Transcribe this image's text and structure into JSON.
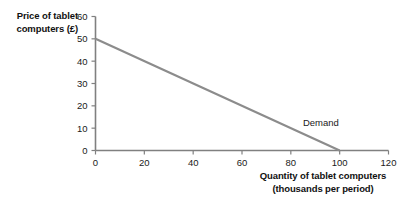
{
  "chart_data": {
    "type": "line",
    "title": "",
    "xlabel": "Quantity of tablet computers\n(thousands per period)",
    "ylabel": "Price of tablet\ncomputers (£)",
    "xlim": [
      0,
      120
    ],
    "ylim": [
      0,
      60
    ],
    "xticks": [
      "0",
      "20",
      "40",
      "60",
      "80",
      "100",
      "120"
    ],
    "yticks": [
      "0",
      "10",
      "20",
      "30",
      "40",
      "50",
      "60"
    ],
    "xtick_values": [
      0,
      20,
      40,
      60,
      80,
      100,
      120
    ],
    "ytick_values": [
      0,
      10,
      20,
      30,
      40,
      50,
      60
    ],
    "grid": false,
    "legend": "none",
    "series": [
      {
        "name": "Demand",
        "x": [
          0,
          100
        ],
        "values": [
          50,
          0
        ],
        "color": "#8c8c8c",
        "annotation": "Demand"
      }
    ],
    "annotations": [
      {
        "text": "Demand",
        "x": 87,
        "y": 12
      }
    ],
    "axis_color": "#808080",
    "text_color": "#1a1a1a",
    "background": "#ffffff"
  },
  "labels": {
    "y_axis_title": "Price of tablet\ncomputers (£)",
    "x_axis_title": "Quantity of tablet computers\n(thousands per period)",
    "demand_label": "Demand"
  }
}
